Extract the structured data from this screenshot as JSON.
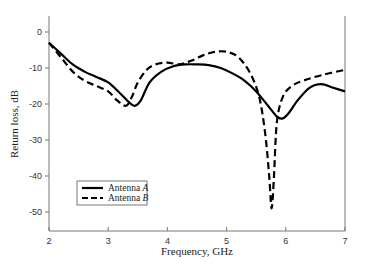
{
  "chart_data": {
    "type": "line",
    "title": "",
    "xlabel": "Frequency, GHz",
    "ylabel": "Return loss, dB",
    "xlim": [
      2,
      7
    ],
    "ylim": [
      -55,
      4.5
    ],
    "xticks": [
      2,
      3,
      4,
      5,
      6,
      7
    ],
    "yticks": [
      0,
      -10,
      -20,
      -30,
      -40,
      -50
    ],
    "grid": false,
    "legend_position": "lower-left",
    "series": [
      {
        "name": "Antenna A",
        "legend_label": "Antenna",
        "legend_italic": "A",
        "style": "solid",
        "color": "#000000",
        "x": [
          2.0,
          2.2,
          2.4,
          2.6,
          2.8,
          3.0,
          3.2,
          3.35,
          3.45,
          3.55,
          3.7,
          3.9,
          4.1,
          4.3,
          4.5,
          4.7,
          4.9,
          5.1,
          5.3,
          5.5,
          5.7,
          5.85,
          5.95,
          6.05,
          6.2,
          6.4,
          6.6,
          6.8,
          7.0
        ],
        "y": [
          -3,
          -6,
          -9,
          -11,
          -12.5,
          -14,
          -17,
          -19.5,
          -20.5,
          -19,
          -14,
          -11,
          -9.5,
          -9,
          -9,
          -9.2,
          -10,
          -11.5,
          -13.5,
          -16.5,
          -20.5,
          -23.5,
          -24,
          -22.5,
          -19,
          -15.5,
          -14.5,
          -15.5,
          -16.5
        ]
      },
      {
        "name": "Antenna B",
        "legend_label": "Antenna",
        "legend_italic": "B",
        "style": "dashed",
        "color": "#000000",
        "x": [
          2.0,
          2.2,
          2.4,
          2.6,
          2.8,
          3.0,
          3.15,
          3.3,
          3.4,
          3.5,
          3.65,
          3.8,
          4.0,
          4.2,
          4.4,
          4.6,
          4.8,
          5.0,
          5.2,
          5.4,
          5.55,
          5.65,
          5.72,
          5.76,
          5.8,
          5.85,
          5.95,
          6.1,
          6.3,
          6.6,
          7.0
        ],
        "y": [
          -3,
          -7,
          -11,
          -13.5,
          -15,
          -16.5,
          -19,
          -20.5,
          -18,
          -14,
          -10.5,
          -9,
          -8.5,
          -9,
          -8,
          -6.5,
          -5.5,
          -5.5,
          -7,
          -11.5,
          -18,
          -28,
          -40,
          -49,
          -40,
          -25,
          -18,
          -15,
          -13.5,
          -12,
          -10.5
        ]
      }
    ],
    "legend": [
      {
        "label": "Antenna",
        "italic": "A",
        "style": "solid"
      },
      {
        "label": "Antenna",
        "italic": "B",
        "style": "dashed"
      }
    ]
  }
}
